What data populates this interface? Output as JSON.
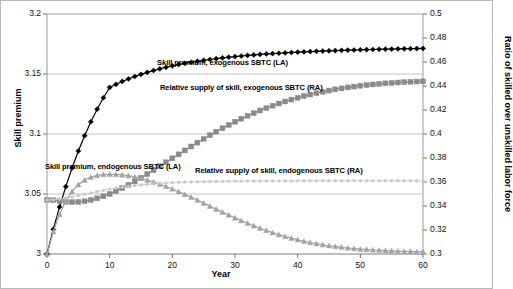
{
  "chart_data": {
    "type": "line",
    "title": "",
    "xlabel": "Year",
    "ylabel": "Skill  premium",
    "y2label": "Ratio of skilled over unskilled labor force",
    "xlim": [
      0,
      60
    ],
    "ylim": [
      3,
      3.2
    ],
    "y2lim": [
      0.3,
      0.5
    ],
    "xticks": [
      0,
      10,
      20,
      30,
      40,
      50,
      60
    ],
    "xticklabels": [
      "0",
      "10",
      "20",
      "30",
      "40",
      "50",
      "60"
    ],
    "yticks": [
      3,
      3.05,
      3.1,
      3.15,
      3.2
    ],
    "yticklabels": [
      "3",
      "3.05",
      "3.1",
      "3.15",
      "3.2"
    ],
    "y2ticks": [
      0.3,
      0.32,
      0.34,
      0.36,
      0.38,
      0.4,
      0.42,
      0.44,
      0.46,
      0.48,
      0.5
    ],
    "y2ticklabels": [
      "0.3",
      "0.32",
      "0.34",
      "0.36",
      "0.38",
      "0.4",
      "0.42",
      "0.44",
      "0.46",
      "0.48",
      "0.5"
    ],
    "grid": "horizontal",
    "legend_position": "inline-annotations",
    "x": [
      0,
      1,
      2,
      3,
      4,
      5,
      6,
      7,
      8,
      9,
      10,
      11,
      12,
      13,
      14,
      15,
      16,
      17,
      18,
      19,
      20,
      21,
      22,
      23,
      24,
      25,
      26,
      27,
      28,
      29,
      30,
      31,
      32,
      33,
      34,
      35,
      36,
      37,
      38,
      39,
      40,
      41,
      42,
      43,
      44,
      45,
      46,
      47,
      48,
      49,
      50,
      51,
      52,
      53,
      54,
      55,
      56,
      57,
      58,
      59,
      60
    ],
    "series": [
      {
        "name": "Skill premium, exogenous SBTC (LA)",
        "axis": "left",
        "marker": "diamond",
        "color": "#000000",
        "label_x": 28,
        "label_y": 3.159,
        "values": [
          3.0,
          3.0205,
          3.0392,
          3.0562,
          3.0717,
          3.0858,
          3.0986,
          3.1102,
          3.1207,
          3.1302,
          3.1388,
          3.1414,
          3.1438,
          3.1459,
          3.1479,
          3.1497,
          3.1514,
          3.1529,
          3.1543,
          3.1556,
          3.1568,
          3.1579,
          3.1589,
          3.1598,
          3.1606,
          3.1614,
          3.1621,
          3.1628,
          3.1634,
          3.164,
          3.1645,
          3.165,
          3.1655,
          3.1659,
          3.1663,
          3.1667,
          3.167,
          3.1673,
          3.1676,
          3.1679,
          3.1682,
          3.1685,
          3.1687,
          3.1689,
          3.1691,
          3.1693,
          3.1695,
          3.1697,
          3.1699,
          3.17,
          3.1702,
          3.1703,
          3.1704,
          3.1706,
          3.1707,
          3.1708,
          3.1709,
          3.171,
          3.1711,
          3.1712,
          3.1713
        ]
      },
      {
        "name": "Relative supply of skill, exogenous SBTC (RA)",
        "axis": "right",
        "marker": "square",
        "color": "#8a8a8a",
        "label_x": 31,
        "label_y": 0.4385,
        "values": [
          0.345,
          0.3448,
          0.344,
          0.3434,
          0.3432,
          0.3434,
          0.344,
          0.345,
          0.3464,
          0.3481,
          0.3501,
          0.3524,
          0.3549,
          0.3576,
          0.3605,
          0.3635,
          0.3666,
          0.3698,
          0.3731,
          0.3764,
          0.3797,
          0.383,
          0.3863,
          0.3896,
          0.3928,
          0.3959,
          0.399,
          0.4019,
          0.4048,
          0.4075,
          0.4102,
          0.4127,
          0.4151,
          0.4174,
          0.4196,
          0.4216,
          0.4236,
          0.4254,
          0.4271,
          0.4287,
          0.4302,
          0.4316,
          0.4329,
          0.4341,
          0.4352,
          0.4362,
          0.4372,
          0.438,
          0.4388,
          0.4395,
          0.4402,
          0.4408,
          0.4413,
          0.4418,
          0.4422,
          0.4426,
          0.4429,
          0.4432,
          0.4435,
          0.4437,
          0.4439
        ]
      },
      {
        "name": "Skill premium, endogenous SBTC (LA)",
        "axis": "left",
        "marker": "triangle",
        "color": "#a3a3a3",
        "label_x": 10.5,
        "label_y": 3.0725,
        "values": [
          3.0,
          3.0185,
          3.033,
          3.0442,
          3.0522,
          3.0578,
          3.0616,
          3.0641,
          3.0655,
          3.0662,
          3.0664,
          3.0663,
          3.0659,
          3.0652,
          3.0642,
          3.063,
          3.0616,
          3.06,
          3.0582,
          3.0563,
          3.0542,
          3.052,
          3.0497,
          3.0473,
          3.0449,
          3.0424,
          3.0399,
          3.0374,
          3.0349,
          3.0325,
          3.0301,
          3.0278,
          3.0256,
          3.0235,
          3.0215,
          3.0196,
          3.0178,
          3.0161,
          3.0146,
          3.0132,
          3.0119,
          3.0107,
          3.0096,
          3.0086,
          3.0077,
          3.0069,
          3.0062,
          3.0056,
          3.005,
          3.0045,
          3.0041,
          3.0037,
          3.0034,
          3.0031,
          3.0028,
          3.0026,
          3.0024,
          3.0022,
          3.0021,
          3.002,
          3.0019
        ]
      },
      {
        "name": "Relative supply of skill, endogenous SBTC (RA)",
        "axis": "right",
        "marker": "dot",
        "color": "#c8c8c8",
        "label_x": 37,
        "label_y": 0.3695,
        "values": [
          0.345,
          0.3452,
          0.3458,
          0.3466,
          0.3476,
          0.3487,
          0.3498,
          0.3509,
          0.352,
          0.353,
          0.354,
          0.3549,
          0.3557,
          0.3564,
          0.357,
          0.3576,
          0.3581,
          0.3585,
          0.3589,
          0.3592,
          0.3595,
          0.3597,
          0.3599,
          0.3601,
          0.3602,
          0.3603,
          0.3604,
          0.3605,
          0.3606,
          0.3606,
          0.3607,
          0.3607,
          0.3608,
          0.3608,
          0.3608,
          0.3609,
          0.3609,
          0.3609,
          0.3609,
          0.3609,
          0.361,
          0.361,
          0.361,
          0.361,
          0.361,
          0.361,
          0.361,
          0.361,
          0.361,
          0.361,
          0.361,
          0.361,
          0.361,
          0.361,
          0.361,
          0.361,
          0.361,
          0.361,
          0.361,
          0.361,
          0.361
        ]
      }
    ]
  }
}
